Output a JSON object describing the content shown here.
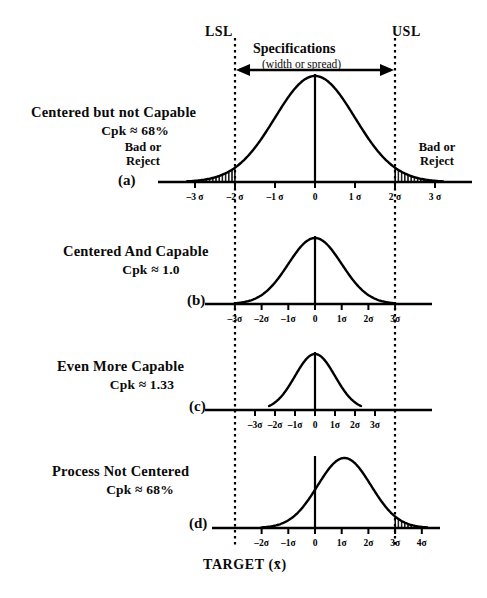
{
  "figure": {
    "background": "#ffffff",
    "ink": "#000000",
    "spec": {
      "lsl_label": "LSL",
      "usl_label": "USL",
      "title": "Specifications",
      "subtitle": "(width or spread)"
    },
    "axis_title": "TARGET (x̄)",
    "reject_label_line1": "Bad or",
    "reject_label_line2": "Reject"
  },
  "panels": [
    {
      "key": "a",
      "panel_label": "(a)",
      "title": "Centered but not Capable",
      "cpk": "Cpk ≈ 68%",
      "ticks": [
        "–3 σ",
        "–2 σ",
        "–1 σ",
        "0",
        "1 σ",
        "2 σ",
        "3 σ"
      ],
      "tick_values": [
        -3,
        -2,
        -1,
        0,
        1,
        2,
        3
      ],
      "reject_regions": [
        "left",
        "right"
      ],
      "reject_labels": [
        "Bad or Reject",
        "Bad or Reject"
      ]
    },
    {
      "key": "b",
      "panel_label": "(b)",
      "title": "Centered And Capable",
      "cpk": "Cpk ≈ 1.0",
      "ticks": [
        "–3σ",
        "–2σ",
        "–1σ",
        "0",
        "1σ",
        "2σ",
        "3σ"
      ],
      "tick_values": [
        -3,
        -2,
        -1,
        0,
        1,
        2,
        3
      ],
      "reject_regions": [],
      "reject_labels": []
    },
    {
      "key": "c",
      "panel_label": "(c)",
      "title": "Even More Capable",
      "cpk": "Cpk ≈ 1.33",
      "ticks": [
        "–3σ",
        "–2σ",
        "–1σ",
        "0",
        "1σ",
        "2σ",
        "3σ"
      ],
      "tick_values": [
        -3,
        -2,
        -1,
        0,
        1,
        2,
        3
      ],
      "reject_regions": [],
      "reject_labels": []
    },
    {
      "key": "d",
      "panel_label": "(d)",
      "title": "Process Not Centered",
      "cpk": "Cpk ≈ 68%",
      "ticks": [
        "–2σ",
        "–1σ",
        "0",
        "1σ",
        "2σ",
        "3σ",
        "4σ"
      ],
      "tick_values": [
        -2,
        -1,
        0,
        1,
        2,
        3,
        4
      ],
      "reject_regions": [
        "right"
      ],
      "reject_labels": []
    }
  ],
  "chart_data": {
    "type": "line",
    "xlabel": "TARGET (x̄)",
    "ylabel": "",
    "grid": false,
    "legend": "none",
    "spec_limits": {
      "lsl_x_px": 235,
      "usl_x_px": 395,
      "label_low": "LSL",
      "label_high": "USL"
    },
    "series": [
      {
        "name": "(a) Centered but not Capable",
        "cpk": "68%",
        "mean_sigma": 0,
        "sigma_px_per_unit": 40,
        "curve_half_width_sigma": 3.2,
        "center_x_px": 315,
        "baseline_y_px": 182,
        "peak_height_px": 106,
        "spec_at_sigma": [
          -2,
          2
        ],
        "out_of_spec": true,
        "reject_tails": [
          "left",
          "right"
        ]
      },
      {
        "name": "(b) Centered And Capable",
        "cpk": "1.0",
        "mean_sigma": 0,
        "sigma_px_per_unit": 26.7,
        "curve_half_width_sigma": 3.0,
        "center_x_px": 315,
        "baseline_y_px": 304,
        "peak_height_px": 66,
        "spec_at_sigma": [
          -3,
          3
        ],
        "out_of_spec": false,
        "reject_tails": []
      },
      {
        "name": "(c) Even More Capable",
        "cpk": "1.33",
        "mean_sigma": 0,
        "sigma_px_per_unit": 20,
        "curve_half_width_sigma": 2.3,
        "center_x_px": 315,
        "baseline_y_px": 410,
        "peak_height_px": 56,
        "spec_at_sigma": [
          -4,
          4
        ],
        "out_of_spec": false,
        "reject_tails": []
      },
      {
        "name": "(d) Process Not Centered",
        "cpk": "68%",
        "mean_sigma": 1.1,
        "sigma_px_per_unit": 26.7,
        "curve_half_width_sigma": 3.1,
        "center_x_px": 315,
        "baseline_y_px": 528,
        "peak_height_px": 70,
        "spec_at_sigma": [
          -3,
          3
        ],
        "out_of_spec": true,
        "reject_tails": [
          "right"
        ]
      }
    ]
  }
}
